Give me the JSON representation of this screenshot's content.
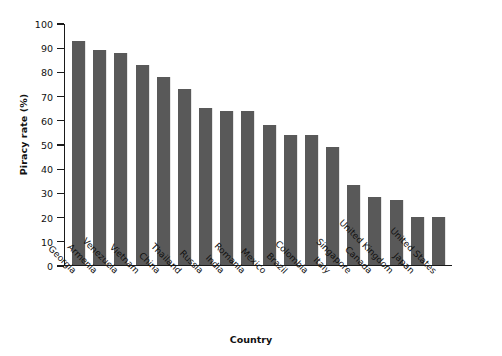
{
  "chart_data": {
    "type": "bar",
    "title": "",
    "xlabel": "Country",
    "ylabel": "Piracy rate (%)",
    "categories": [
      "Georgia",
      "Armenia",
      "Venezuela",
      "Vietnam",
      "China",
      "Thailand",
      "Russia",
      "India",
      "Romania",
      "Mexico",
      "Brazil",
      "Colombia",
      "Italy",
      "Singapore",
      "Canada",
      "United Kingdom",
      "Japan",
      "United States"
    ],
    "values": [
      93,
      89,
      88,
      83,
      78,
      73,
      65,
      64,
      64,
      58,
      54,
      54,
      49,
      33,
      28,
      27,
      20,
      20
    ],
    "ylim": [
      0,
      100
    ],
    "ytick_labels": [
      "100",
      "90",
      "80",
      "70",
      "60",
      "50",
      "40",
      "30",
      "20",
      "10",
      "0"
    ],
    "ytick_values": [
      100,
      90,
      80,
      70,
      60,
      50,
      40,
      30,
      20,
      10,
      0
    ],
    "grid": false,
    "legend": "none",
    "bar_color": "#595959",
    "axis_color": "#1a1a1a",
    "background_color": "#ffffff"
  }
}
